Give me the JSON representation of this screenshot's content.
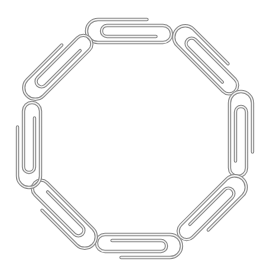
{
  "image": {
    "description": "Eight silver paperclips linked together forming an octagon ring on a white background",
    "subject": "paperclip chain",
    "shape": "octagon",
    "clip_count": 8,
    "background_color": "#ffffff",
    "wire_color": "#8c8c8c",
    "wire_highlight_color": "#f4f4f4"
  },
  "clips": [
    {
      "name": "top",
      "cx": 133,
      "cy": 31,
      "angle": 0
    },
    {
      "name": "top-right",
      "cx": 210,
      "cy": 62,
      "angle": 45
    },
    {
      "name": "right",
      "cx": 241,
      "cy": 138,
      "angle": 90
    },
    {
      "name": "bottom-right",
      "cx": 210,
      "cy": 212,
      "angle": 135
    },
    {
      "name": "bottom",
      "cx": 135,
      "cy": 246,
      "angle": 180
    },
    {
      "name": "bottom-left",
      "cx": 60,
      "cy": 212,
      "angle": 225
    },
    {
      "name": "left",
      "cx": 29,
      "cy": 141,
      "angle": 270
    },
    {
      "name": "top-left",
      "cx": 60,
      "cy": 63,
      "angle": 315
    }
  ]
}
